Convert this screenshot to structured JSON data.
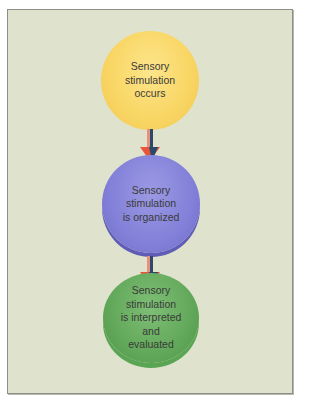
{
  "diagram": {
    "type": "flowchart",
    "background_color": "#dfe2cc",
    "nodes": [
      {
        "id": "step1",
        "lines": [
          "Sensory",
          "stimulation",
          "occurs"
        ],
        "color": "#f9d766"
      },
      {
        "id": "step2",
        "lines": [
          "Sensory",
          "stimulation",
          "is organized"
        ],
        "color": "#8280d8"
      },
      {
        "id": "step3",
        "lines": [
          "Sensory",
          "stimulation",
          "is interpreted",
          "and",
          "evaluated"
        ],
        "color": "#62a85a"
      }
    ],
    "edges": [
      {
        "from": "step1",
        "to": "step2",
        "color": "#e8553a"
      },
      {
        "from": "step2",
        "to": "step3",
        "color": "#e8553a"
      }
    ]
  }
}
